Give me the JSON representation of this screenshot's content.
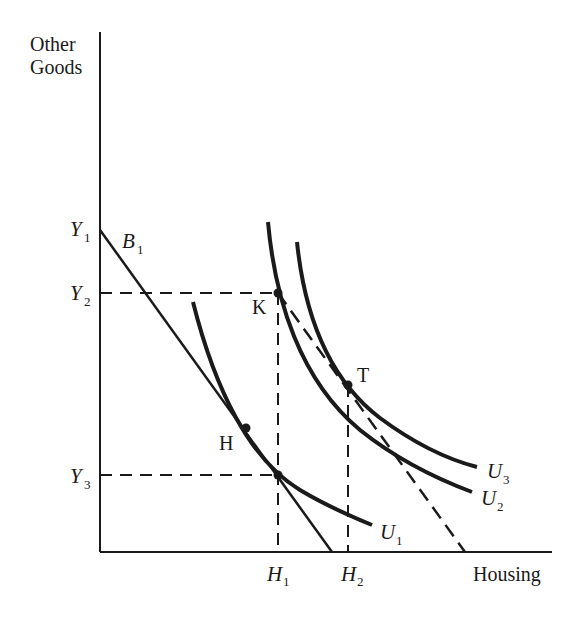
{
  "axes": {
    "y_label_line1": "Other",
    "y_label_line2": "Goods",
    "x_label": "Housing"
  },
  "y_ticks": [
    {
      "letter": "Y",
      "sub": "1"
    },
    {
      "letter": "Y",
      "sub": "2"
    },
    {
      "letter": "Y",
      "sub": "3"
    }
  ],
  "x_ticks": [
    {
      "letter": "H",
      "sub": "1"
    },
    {
      "letter": "H",
      "sub": "2"
    }
  ],
  "budget_line": {
    "letter": "B",
    "sub": "1"
  },
  "curves": [
    {
      "letter": "U",
      "sub": "1"
    },
    {
      "letter": "U",
      "sub": "2"
    },
    {
      "letter": "U",
      "sub": "3"
    }
  ],
  "points": {
    "K": "K",
    "T": "T",
    "H": "H"
  },
  "colors": {
    "ink": "#1a1a1a",
    "background": "#ffffff"
  }
}
